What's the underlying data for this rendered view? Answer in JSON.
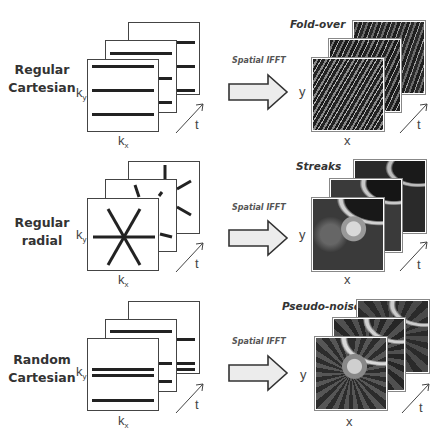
{
  "rows": [
    {
      "label_line1": "Regular",
      "label_line2": "Cartesian",
      "sampling": "regular-cartesian",
      "transform_label": "Spatial IFFT",
      "artifact_label": "Fold-over"
    },
    {
      "label_line1": "Regular",
      "label_line2": "radial",
      "sampling": "regular-radial",
      "transform_label": "Spatial IFFT",
      "artifact_label": "Streaks"
    },
    {
      "label_line1": "Random",
      "label_line2": "Cartesian",
      "sampling": "random-cartesian",
      "transform_label": "Spatial IFFT",
      "artifact_label": "Pseudo-noise"
    }
  ],
  "axes": {
    "k_y": "k",
    "k_y_sub": "y",
    "k_x": "k",
    "k_x_sub": "x",
    "t": "t",
    "y": "y",
    "x": "x"
  },
  "colors": {
    "line": "#222222",
    "frame_border": "#444444",
    "arrow_fill": "#ececec",
    "arrow_stroke": "#333333"
  }
}
